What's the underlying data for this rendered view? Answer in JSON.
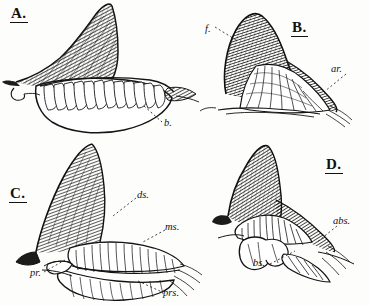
{
  "plate": {
    "title": "Comparative fin skeleton plate",
    "background_color": "#fdfdfc",
    "ink_color": "#111111",
    "panels": [
      {
        "id": "A",
        "letter": "A.",
        "subject": "Elasmobranch fin with segmented basal cartilage",
        "annotations": [
          {
            "key": "b",
            "label": "b.",
            "meaning": "basal cartilage"
          }
        ]
      },
      {
        "id": "B",
        "letter": "B.",
        "subject": "Fin with fringe and articular radials",
        "annotations": [
          {
            "key": "f",
            "label": "f.",
            "meaning": "fringe"
          },
          {
            "key": "ar",
            "label": "ar.",
            "meaning": "articular radials"
          }
        ]
      },
      {
        "id": "C",
        "letter": "C.",
        "subject": "Fin with distal, middle and proximal segments",
        "annotations": [
          {
            "key": "ds",
            "label": "ds.",
            "meaning": "distal segment"
          },
          {
            "key": "ms",
            "label": "ms.",
            "meaning": "middle segment"
          },
          {
            "key": "pr",
            "label": "pr.",
            "meaning": "propterygium"
          },
          {
            "key": "prs",
            "label": "prs.",
            "meaning": "proximal segment"
          }
        ]
      },
      {
        "id": "D",
        "letter": "D.",
        "subject": "Fin with basal and accessory basal cartilages",
        "annotations": [
          {
            "key": "abs",
            "label": "abs.",
            "meaning": "accessory basal segment"
          },
          {
            "key": "bs",
            "label": "bs.",
            "meaning": "basal segment"
          }
        ]
      }
    ]
  }
}
